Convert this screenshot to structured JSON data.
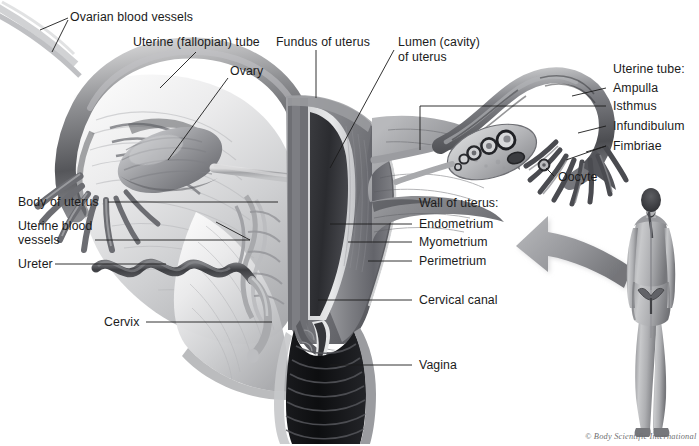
{
  "figure": {
    "background_color": "#ffffff",
    "label_color": "#1b1b1b",
    "credit_color": "#6f6f72",
    "width": 699,
    "height": 446
  },
  "labels": {
    "ovarian_blood_vessels": "Ovarian blood vessels",
    "uterine_fallopian_tube": "Uterine (fallopian) tube",
    "ovary": "Ovary",
    "fundus_of_uterus": "Fundus of uterus",
    "lumen_cavity_line1": "Lumen (cavity)",
    "lumen_cavity_line2": "of uterus",
    "uterine_tube_group": "Uterine tube:",
    "ampulla": "Ampulla",
    "isthmus": "Isthmus",
    "infundibulum": "Infundibulum",
    "fimbriae": "Fimbriae",
    "oocyte": "Oocyte",
    "body_of_uterus": "Body of uterus",
    "uterine_blood_vessels_line1": "Uterine blood",
    "uterine_blood_vessels_line2": "vessels",
    "ureter": "Ureter",
    "cervix": "Cervix",
    "wall_of_uterus_group": "Wall of uterus:",
    "endometrium": "Endometrium",
    "myometrium": "Myometrium",
    "perimetrium": "Perimetrium",
    "cervical_canal": "Cervical canal",
    "vagina": "Vagina"
  },
  "credit": "© Body Scientific International"
}
